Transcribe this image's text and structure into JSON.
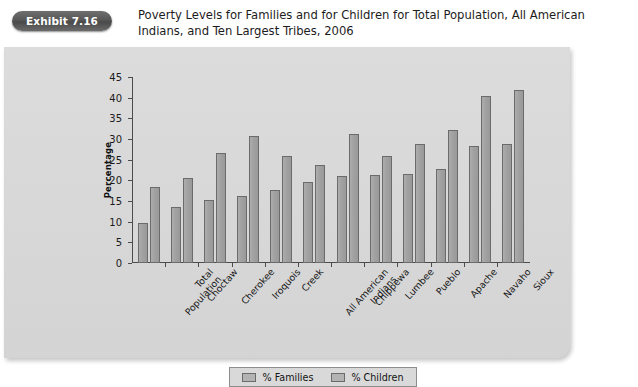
{
  "header": {
    "badge_label": "Exhibit 7.16",
    "title": "Poverty Levels for Families and for Children for Total Population, All American Indians, and Ten Largest Tribes, 2006"
  },
  "legend": {
    "items": [
      {
        "label": "% Families",
        "color": "#b3b3b3"
      },
      {
        "label": "% Children",
        "color": "#b3b3b3"
      }
    ],
    "position": "bottom-center"
  },
  "chart_data": {
    "type": "bar",
    "title": "Poverty Levels for Families and for Children for Total Population, All American Indians, and Ten Largest Tribes, 2006",
    "xlabel": "",
    "ylabel": "Percentage",
    "ylim": [
      0,
      45
    ],
    "yticks": [
      0,
      5,
      10,
      15,
      20,
      25,
      30,
      35,
      40,
      45
    ],
    "grid": false,
    "legend_position": "bottom-center",
    "categories": [
      "Total\nPopulation",
      "Choctaw",
      "Cherokee",
      "Iroquois",
      "Creek",
      "All American\nIndians",
      "Chippewa",
      "Lumbee",
      "Pueblo",
      "Apache",
      "Navaho",
      "Sioux"
    ],
    "series": [
      {
        "name": "% Families",
        "values": [
          9.8,
          13.5,
          15.3,
          16.2,
          17.7,
          19.6,
          21.0,
          21.2,
          21.5,
          22.8,
          28.3,
          28.8
        ]
      },
      {
        "name": "% Children",
        "values": [
          18.3,
          20.5,
          26.5,
          30.7,
          25.8,
          23.6,
          31.3,
          26.0,
          28.8,
          32.2,
          40.5,
          41.8
        ]
      }
    ]
  }
}
